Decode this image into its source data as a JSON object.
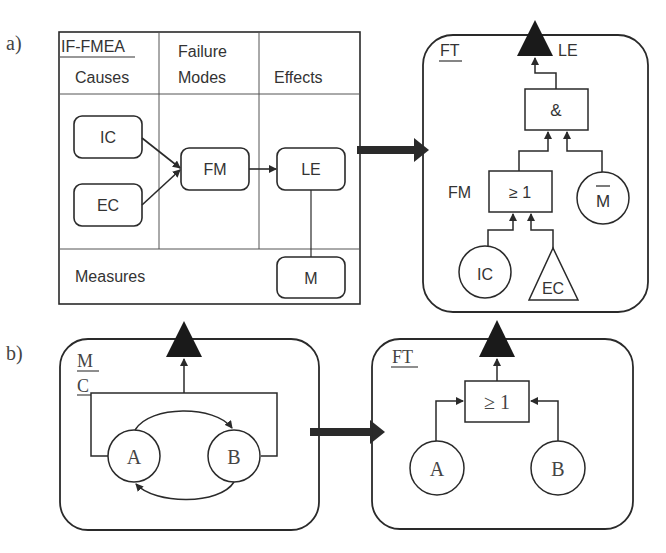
{
  "panel_a": {
    "label": "a)",
    "fmea_table": {
      "title": "IF-FMEA",
      "columns": [
        "Causes",
        "Failure",
        "Modes",
        "Effects"
      ],
      "col_headers": [
        {
          "line1": "Causes"
        },
        {
          "line1": "Failure",
          "line2": "Modes"
        },
        {
          "line1": "Effects"
        }
      ],
      "measures_label": "Measures",
      "nodes": {
        "ic": "IC",
        "ec": "EC",
        "fm": "FM",
        "le": "LE",
        "m": "M"
      }
    },
    "fault_tree": {
      "title": "FT",
      "top_event_label": "LE",
      "and_gate": "&",
      "or_gate": "≥ 1",
      "or_gate_label": "FM",
      "not_measure": "M",
      "basic_ic": "IC",
      "undeveloped_ec": "EC"
    }
  },
  "panel_b": {
    "label": "b)",
    "model": {
      "title_line1": "M",
      "title_line2": "C",
      "node_a": "A",
      "node_b": "B"
    },
    "fault_tree": {
      "title": "FT",
      "or_gate": "≥ 1",
      "node_a": "A",
      "node_b": "B"
    }
  },
  "colors": {
    "stroke": "#2a2a2a",
    "fill_dark": "#1a1a1a",
    "background": "#ffffff"
  }
}
